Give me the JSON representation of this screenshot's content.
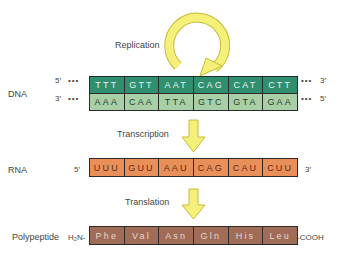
{
  "colors": {
    "dna_template_strand": "#2f8f6e",
    "dna_complement_strand": "#a9cfa6",
    "rna": "#e9905a",
    "polypeptide": "#a06c58",
    "arrow": "#f4f07a",
    "arrow_outline": "#c9bb3a"
  },
  "processes": {
    "replication": "Replication",
    "transcription": "Transcription",
    "translation": "Translation"
  },
  "dna": {
    "label": "DNA",
    "top_strand": {
      "left_end": "5′",
      "right_end": "3′",
      "dots": "•••",
      "codons": [
        "TTT",
        "GTT",
        "AAT",
        "CAG",
        "CAT",
        "CTT"
      ]
    },
    "bottom_strand": {
      "left_end": "3′",
      "right_end": "5′",
      "dots": "•••",
      "codons": [
        "AAA",
        "CAA",
        "TTA",
        "GTC",
        "GTA",
        "GAA"
      ]
    }
  },
  "rna": {
    "label": "RNA",
    "left_end": "5′",
    "right_end": "3′",
    "codons": [
      "UUU",
      "GUU",
      "AAU",
      "CAG",
      "CAU",
      "CUU"
    ]
  },
  "polypeptide": {
    "label": "Polypeptide",
    "n_terminus": "H₂N-",
    "c_terminus": "-COOH",
    "amino_acids": [
      "Phe",
      "Val",
      "Asn",
      "Gln",
      "His",
      "Leu"
    ]
  }
}
